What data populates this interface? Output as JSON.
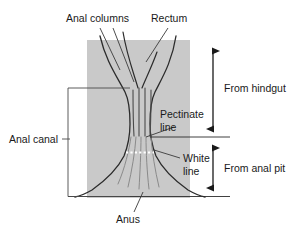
{
  "figure": {
    "colors": {
      "background": "#ffffff",
      "tissue_block": "#c9c9c9",
      "outline": "#2b2b2b",
      "text": "#1a1a1a",
      "white_line": "#ffffff",
      "leader": "#3a3a3a"
    }
  },
  "labels": {
    "anal_columns": "Anal columns",
    "rectum": "Rectum",
    "pectinate_line_1": "Pectinate",
    "pectinate_line_2": "line",
    "white_line_1": "White",
    "white_line_2": "line",
    "anal_canal": "Anal canal",
    "anus": "Anus",
    "from_hindgut": "From hindgut",
    "from_anal_pit": "From anal pit"
  }
}
